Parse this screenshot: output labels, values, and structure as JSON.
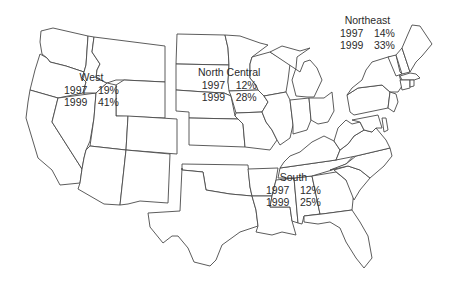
{
  "map": {
    "subject": "United States by census region",
    "colors": {
      "outline": "#4a4a4a",
      "fill": "#ffffff",
      "text": "#2b2b2b"
    }
  },
  "regions": [
    {
      "name": "West",
      "rows": [
        {
          "year": "1997",
          "value": "19%"
        },
        {
          "year": "1999",
          "value": "41%"
        }
      ]
    },
    {
      "name": "North Central",
      "rows": [
        {
          "year": "1997",
          "value": "12%"
        },
        {
          "year": "1999",
          "value": "28%"
        }
      ]
    },
    {
      "name": "Northeast",
      "rows": [
        {
          "year": "1997",
          "value": "14%"
        },
        {
          "year": "1999",
          "value": "33%"
        }
      ]
    },
    {
      "name": "South",
      "rows": [
        {
          "year": "1997",
          "value": "12%"
        },
        {
          "year": "1999",
          "value": "25%"
        }
      ]
    }
  ]
}
